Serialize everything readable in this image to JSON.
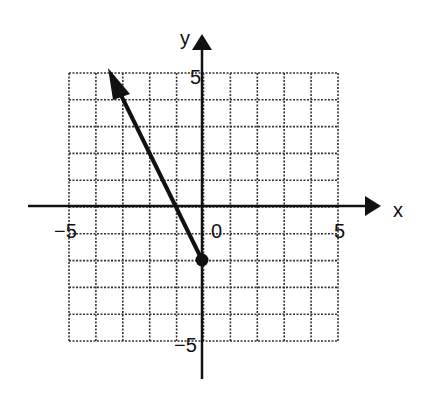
{
  "chart_data": {
    "type": "line",
    "title": "",
    "xlabel": "x",
    "ylabel": "y",
    "xlim": [
      -5,
      5
    ],
    "ylim": [
      -5,
      5
    ],
    "grid": true,
    "grid_style": "dashed",
    "tick_labels": {
      "x": [
        "-5",
        "0",
        "5"
      ],
      "y": [
        "5",
        "-5"
      ]
    },
    "series": [
      {
        "name": "ray",
        "kind": "ray",
        "start_point": {
          "x": 0,
          "y": -2,
          "marker": "filled-circle"
        },
        "direction_through": {
          "x": -1,
          "y": 0
        },
        "arrow_end": {
          "x": -3.5,
          "y": 5.1
        },
        "slope": -2,
        "y_intercept": -2,
        "points": [
          {
            "x": 0,
            "y": -2
          },
          {
            "x": -1,
            "y": 0
          },
          {
            "x": -3.5,
            "y": 5
          }
        ]
      }
    ]
  },
  "labels": {
    "x_axis": "x",
    "y_axis": "y",
    "x_min": "−5",
    "x_max": "5",
    "origin": "0",
    "y_max": "5",
    "y_min": "−5"
  },
  "colors": {
    "axis": "#111111",
    "grid": "#333333",
    "ray": "#111111",
    "background": "#ffffff"
  }
}
